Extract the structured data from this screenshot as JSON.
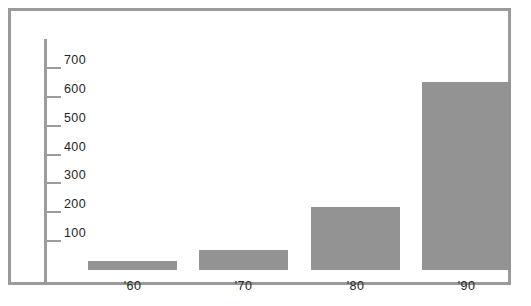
{
  "chart_data": {
    "type": "bar",
    "title": "",
    "subtitle": "",
    "xlabel": "",
    "ylabel": "",
    "categories": [
      "'60",
      "'70",
      "'80",
      "'90"
    ],
    "values": [
      30,
      70,
      220,
      650
    ],
    "series": [
      {
        "name": "",
        "values": [
          30,
          70,
          220,
          650
        ]
      }
    ],
    "ylim": [
      0,
      750
    ],
    "yticks": [
      100,
      200,
      300,
      400,
      500,
      600,
      700
    ],
    "ytick_labels": [
      "100",
      "200",
      "300",
      "400",
      "500",
      "600",
      "700"
    ],
    "xtick_labels": [
      "'60",
      "'70",
      "'80",
      "'90"
    ],
    "grid": false,
    "legend": false,
    "legend_position": "none",
    "bar_color": "#939393",
    "axis_color": "#9c9c9c",
    "frame_color": "#9a9a9a",
    "text_color": "#262626",
    "background_color": "#ffffff",
    "annotations": []
  },
  "figure": {
    "frame_label": "chart-frame",
    "plot_label": "plot-area"
  }
}
